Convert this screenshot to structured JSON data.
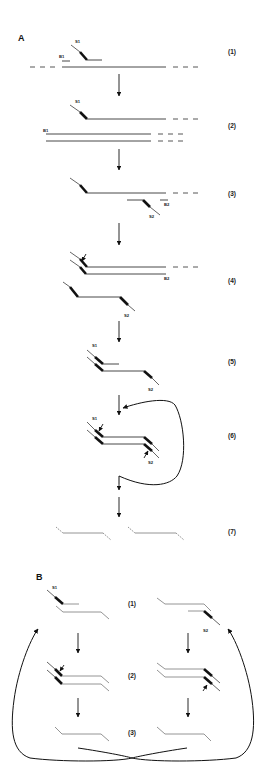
{
  "figure": {
    "panels": [
      {
        "id": "A",
        "label": "A",
        "steps": [
          {
            "label": "(1)",
            "tags": [
              "S1",
              "B1"
            ]
          },
          {
            "label": "(2)",
            "tags": [
              "S1",
              "B1"
            ]
          },
          {
            "label": "(3)",
            "tags": [
              "B2",
              "S2"
            ]
          },
          {
            "label": "(4)",
            "tags": [
              "B2",
              "S2"
            ]
          },
          {
            "label": "(5)",
            "tags": [
              "S1",
              "S2"
            ]
          },
          {
            "label": "(6)",
            "tags": [
              "S1",
              "S2"
            ]
          },
          {
            "label": "(7)",
            "tags": []
          }
        ]
      },
      {
        "id": "B",
        "label": "B",
        "steps": [
          {
            "label": "(1)",
            "tags": [
              "S1",
              "S2"
            ]
          },
          {
            "label": "(2)",
            "tags": []
          },
          {
            "label": "(3)",
            "tags": []
          }
        ]
      }
    ],
    "colors": {
      "strand": "#333333",
      "product_strand": "#888888",
      "primer": "#111111",
      "background": "#ffffff"
    }
  }
}
